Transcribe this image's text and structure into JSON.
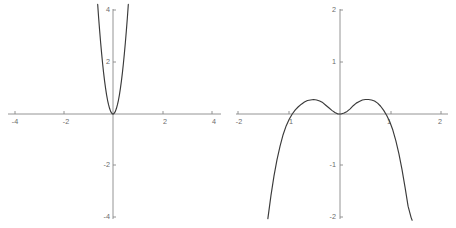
{
  "figure": {
    "background_color": "#ffffff",
    "axis_color": "#888888",
    "curve_color": "#3a3a3a",
    "label_color": "#6b6b6b"
  },
  "chart_data": [
    {
      "type": "line",
      "title": "",
      "xlabel": "",
      "ylabel": "",
      "xlim": [
        -4.5,
        4.5
      ],
      "ylim": [
        -4.4,
        4.4
      ],
      "grid": false,
      "legend": "none",
      "xticks": [
        -4,
        -2,
        2,
        4
      ],
      "xtick_labels": [
        "-4",
        "-2",
        "2",
        "4"
      ],
      "yticks": [
        4,
        2,
        -2,
        -4
      ],
      "ytick_labels": [
        "4",
        "2",
        "-2",
        "-4"
      ],
      "annotation": "narrow upward parabola, even power, vertex at origin",
      "series": [
        {
          "name": "left-curve",
          "x": [
            -0.62,
            -0.58,
            -0.54,
            -0.5,
            -0.46,
            -0.42,
            -0.38,
            -0.34,
            -0.3,
            -0.26,
            -0.22,
            -0.18,
            -0.14,
            -0.1,
            -0.06,
            -0.02,
            0.02,
            0.06,
            0.1,
            0.14,
            0.18,
            0.22,
            0.26,
            0.3,
            0.34,
            0.38,
            0.42,
            0.46,
            0.5,
            0.54,
            0.58,
            0.62
          ],
          "y": [
            4.23,
            3.7,
            3.21,
            2.75,
            2.33,
            1.94,
            1.59,
            1.27,
            0.99,
            0.74,
            0.53,
            0.36,
            0.22,
            0.11,
            0.04,
            0.0,
            0.0,
            0.04,
            0.11,
            0.22,
            0.36,
            0.53,
            0.74,
            0.99,
            1.27,
            1.59,
            1.94,
            2.33,
            2.75,
            3.21,
            3.7,
            4.23
          ]
        }
      ]
    },
    {
      "type": "line",
      "title": "",
      "xlabel": "",
      "ylabel": "",
      "xlim": [
        -2.25,
        2.25
      ],
      "ylim": [
        -2.2,
        2.2
      ],
      "grid": false,
      "legend": "none",
      "xticks": [
        -2,
        -1,
        1,
        2
      ],
      "xtick_labels": [
        "-2",
        "1",
        "1",
        "2"
      ],
      "yticks": [
        2,
        1,
        -1,
        -2
      ],
      "ytick_labels": [
        "2",
        "1",
        "-1",
        "-2"
      ],
      "annotation": "even degree-6 curve: local min at origin, two local maxima near x = +/-0.62, falls steeply past x = +/-1",
      "series": [
        {
          "name": "right-curve",
          "x": [
            -1.42,
            -1.36,
            -1.3,
            -1.24,
            -1.18,
            -1.12,
            -1.06,
            -1.0,
            -0.94,
            -0.88,
            -0.82,
            -0.76,
            -0.7,
            -0.64,
            -0.58,
            -0.52,
            -0.46,
            -0.4,
            -0.34,
            -0.28,
            -0.22,
            -0.16,
            -0.1,
            -0.04,
            0.02,
            0.08,
            0.14,
            0.2,
            0.26,
            0.32,
            0.38,
            0.44,
            0.5,
            0.56,
            0.62,
            0.68,
            0.74,
            0.8,
            0.86,
            0.92,
            0.98,
            1.04,
            1.1,
            1.16,
            1.22,
            1.28,
            1.34,
            1.4,
            1.42
          ],
          "y": [
            -2.02,
            -1.58,
            -1.2,
            -0.88,
            -0.62,
            -0.4,
            -0.23,
            -0.1,
            0.0,
            0.08,
            0.14,
            0.19,
            0.23,
            0.26,
            0.27,
            0.28,
            0.27,
            0.25,
            0.22,
            0.17,
            0.12,
            0.07,
            0.03,
            0.0,
            0.0,
            0.02,
            0.05,
            0.1,
            0.16,
            0.21,
            0.24,
            0.27,
            0.28,
            0.28,
            0.27,
            0.25,
            0.21,
            0.15,
            0.07,
            -0.03,
            -0.15,
            -0.31,
            -0.52,
            -0.77,
            -1.07,
            -1.41,
            -1.78,
            -2.0,
            -2.05
          ]
        }
      ]
    }
  ],
  "left_plot": {
    "name": "left-parabola-plot",
    "x_axis_labels": [
      {
        "text": "-4",
        "x": 15,
        "y": 124
      },
      {
        "text": "-2",
        "x": 66,
        "y": 124
      },
      {
        "text": "2",
        "x": 165,
        "y": 124
      },
      {
        "text": "4",
        "x": 214,
        "y": 124
      }
    ],
    "y_axis_labels": [
      {
        "text": "4",
        "x": 110,
        "y": 12
      },
      {
        "text": "2",
        "x": 110,
        "y": 64
      },
      {
        "text": "-2",
        "x": 110,
        "y": 167
      },
      {
        "text": "-4",
        "x": 110,
        "y": 219
      }
    ]
  },
  "right_plot": {
    "name": "right-sextic-plot",
    "x_axis_labels": [
      {
        "text": "-2",
        "x": 11,
        "y": 124
      },
      {
        "text": "1",
        "x": 63,
        "y": 124
      },
      {
        "text": "1",
        "x": 161,
        "y": 124
      },
      {
        "text": "2",
        "x": 212,
        "y": 124
      }
    ],
    "y_axis_labels": [
      {
        "text": "2",
        "x": 108,
        "y": 12
      },
      {
        "text": "1",
        "x": 108,
        "y": 64
      },
      {
        "text": "-1",
        "x": 108,
        "y": 167
      },
      {
        "text": "-2",
        "x": 108,
        "y": 219
      }
    ]
  }
}
